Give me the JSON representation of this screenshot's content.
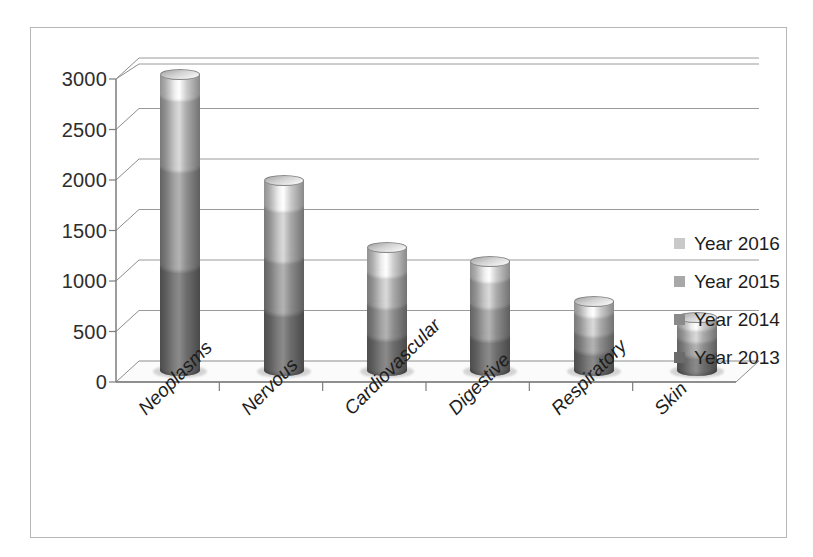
{
  "chart_data": {
    "type": "bar",
    "subtype": "3d-stacked-cylinder",
    "title": "",
    "xlabel": "",
    "ylabel": "",
    "ylim": [
      0,
      3000
    ],
    "yticks": [
      0,
      500,
      1000,
      1500,
      2000,
      2500,
      3000
    ],
    "grid": true,
    "legend_position": "right",
    "categories": [
      "Neoplasms",
      "Nervous",
      "Cardiovascular",
      "Digestive",
      "Respiratory",
      "Skin"
    ],
    "series": [
      {
        "name": "Year 2013",
        "color": "#6b6b6b",
        "values": [
          1020,
          580,
          340,
          330,
          200,
          170
        ]
      },
      {
        "name": "Year 2014",
        "color": "#8a8a8a",
        "values": [
          980,
          520,
          300,
          310,
          170,
          140
        ]
      },
      {
        "name": "Year 2015",
        "color": "#a8a8a8",
        "values": [
          700,
          500,
          310,
          260,
          180,
          120
        ]
      },
      {
        "name": "Year 2016",
        "color": "#c9c9c9",
        "values": [
          230,
          280,
          270,
          180,
          130,
          90
        ]
      }
    ],
    "totals": [
      2930,
      1880,
      1220,
      1080,
      680,
      520
    ]
  },
  "legend": {
    "items": [
      {
        "label": "Year 2016",
        "color": "#c9c9c9"
      },
      {
        "label": "Year 2015",
        "color": "#a8a8a8"
      },
      {
        "label": "Year 2014",
        "color": "#8a8a8a"
      },
      {
        "label": "Year 2013",
        "color": "#6b6b6b"
      }
    ]
  },
  "axis": {
    "ytick_labels": [
      "3000",
      "2500",
      "2000",
      "1500",
      "1000",
      "500",
      "0"
    ]
  },
  "style": {
    "plot_border": "#b6b6b6",
    "gridline": "#9a9a9a",
    "axis_line": "#7d7d7d",
    "floor_fill": "#fbfbfb",
    "text": "#1d1d1d",
    "background": "#ffffff"
  }
}
